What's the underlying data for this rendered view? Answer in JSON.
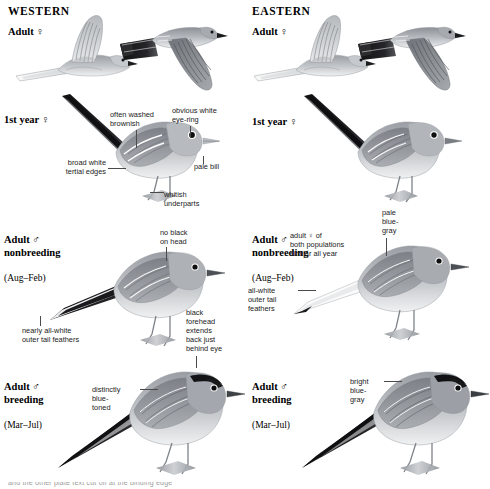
{
  "plate": {
    "columns": [
      {
        "id": "western",
        "heading": "WESTERN"
      },
      {
        "id": "eastern",
        "heading": "EASTERN"
      }
    ],
    "bottom_sliver_text": "and the other plate text cut off at the binding edge"
  },
  "western": {
    "rows": [
      {
        "id": "adult-female-flight",
        "age_label": "Adult ♀",
        "figures": [
          "flying-bird-underside",
          "flying-bird-upperside"
        ],
        "callouts": []
      },
      {
        "id": "first-year-female",
        "age_label": "1st year ♀",
        "callouts": [
          {
            "id": "often-washed-brownish",
            "text": "often washed\nbrownish"
          },
          {
            "id": "obvious-white-eye-ring",
            "text": "obvious white\neye-ring"
          },
          {
            "id": "broad-white-tertial-edges",
            "text": "broad white\ntertial edges"
          },
          {
            "id": "pale-bill",
            "text": "pale bill"
          },
          {
            "id": "whitish-underparts",
            "text": "whitish\nunderparts"
          }
        ]
      },
      {
        "id": "adult-male-nonbreeding",
        "age_label": "Adult ♂\nnonbreeding",
        "season": "(Aug–Feb)",
        "callouts": [
          {
            "id": "no-black-on-head",
            "text": "no black\non head"
          },
          {
            "id": "nearly-all-white-outer-tail-feathers",
            "text": "nearly all-white\nouter tail feathers"
          },
          {
            "id": "black-forehead-extends",
            "text": "black\nforehead\nextends\nback just\nbehind eye"
          }
        ]
      },
      {
        "id": "adult-male-breeding",
        "age_label": "Adult ♂\nbreeding",
        "season": "(Mar–Jul)",
        "callouts": [
          {
            "id": "distinctly-blue-toned",
            "text": "distinctly\nblue-\ntoned"
          }
        ]
      }
    ]
  },
  "eastern": {
    "rows": [
      {
        "id": "adult-female-flight",
        "age_label": "Adult ♀",
        "figures": [
          "flying-bird-underside",
          "flying-bird-upperside"
        ],
        "callouts": []
      },
      {
        "id": "first-year-female",
        "age_label": "1st year ♀",
        "callouts": []
      },
      {
        "id": "adult-male-nonbreeding",
        "age_label": "Adult ♂\nnonbreeding",
        "season": "(Aug–Feb)",
        "callouts": [
          {
            "id": "pale-blue-gray",
            "text": "pale\nblue-\ngray"
          },
          {
            "id": "adult-female-both-populations",
            "text": "adult ♀ of\nboth populations\nsimilar all year"
          },
          {
            "id": "all-white-outer-tail-feathers",
            "text": "all-white\nouter tail\nfeathers"
          }
        ]
      },
      {
        "id": "adult-male-breeding",
        "age_label": "Adult ♂\nbreeding",
        "season": "(Mar–Jul)",
        "callouts": [
          {
            "id": "bright-blue-gray",
            "text": "bright\nblue-\ngray"
          }
        ]
      }
    ]
  },
  "colors": {
    "ink": "#111111",
    "leader": "#4a4a4a",
    "body_gray": "#b9bcc0",
    "back_gray": "#93979d",
    "dark_gray": "#6b6f75",
    "tail_black": "#1c1c1c",
    "belly_white": "#f2f3f4",
    "leg_gray": "#8a8d92",
    "branch_gray": "#a9acb0"
  }
}
